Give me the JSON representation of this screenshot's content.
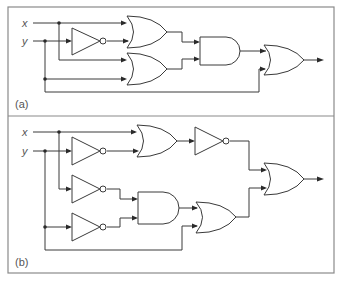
{
  "figure": {
    "panels": [
      {
        "id": "a",
        "label": "(a)",
        "inputs": [
          {
            "name": "x",
            "label": "x"
          },
          {
            "name": "y",
            "label": "y"
          }
        ],
        "gates": [
          {
            "id": "NOT1",
            "type": "NOT",
            "inputs": [
              "y"
            ]
          },
          {
            "id": "OR1",
            "type": "OR",
            "inputs": [
              "x",
              "NOT1"
            ]
          },
          {
            "id": "OR2",
            "type": "OR",
            "inputs": [
              "x",
              "y"
            ]
          },
          {
            "id": "AND1",
            "type": "AND",
            "inputs": [
              "OR1",
              "OR2"
            ]
          },
          {
            "id": "OR3",
            "type": "OR",
            "inputs": [
              "AND1",
              "y"
            ],
            "output": true
          }
        ]
      },
      {
        "id": "b",
        "label": "(b)",
        "inputs": [
          {
            "name": "x",
            "label": "x"
          },
          {
            "name": "y",
            "label": "y"
          }
        ],
        "gates": [
          {
            "id": "NOT1",
            "type": "NOT",
            "inputs": [
              "y"
            ]
          },
          {
            "id": "OR1",
            "type": "OR",
            "inputs": [
              "x",
              "NOT1"
            ]
          },
          {
            "id": "NOT2",
            "type": "NOT",
            "inputs": [
              "OR1"
            ]
          },
          {
            "id": "NOT3",
            "type": "NOT",
            "inputs": [
              "x"
            ]
          },
          {
            "id": "NOT4",
            "type": "NOT",
            "inputs": [
              "y"
            ]
          },
          {
            "id": "AND1",
            "type": "AND",
            "inputs": [
              "NOT3",
              "NOT4"
            ]
          },
          {
            "id": "OR2",
            "type": "OR",
            "inputs": [
              "AND1",
              "y"
            ]
          },
          {
            "id": "OR3",
            "type": "OR",
            "inputs": [
              "NOT2",
              "OR2"
            ],
            "output": true
          }
        ]
      }
    ],
    "colors": {
      "wire": "#3a3a3a",
      "frame": "#8a8a8a",
      "text": "#555555"
    }
  }
}
